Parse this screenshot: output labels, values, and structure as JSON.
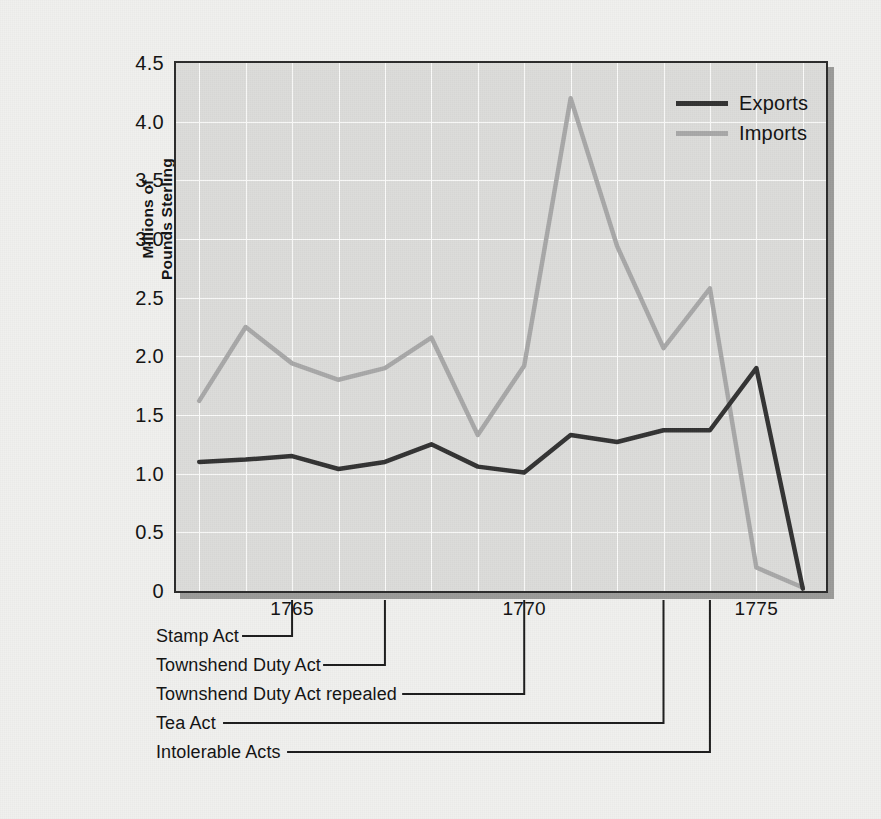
{
  "chart_data": {
    "type": "line",
    "title": "",
    "xlabel": "",
    "ylabel": "Millions of Pounds Sterling",
    "ylabel_lines": [
      "Millions of",
      "Pounds Sterling"
    ],
    "x": [
      1763,
      1764,
      1765,
      1766,
      1767,
      1768,
      1769,
      1770,
      1771,
      1772,
      1773,
      1774,
      1775,
      1776
    ],
    "xlim": [
      1762.5,
      1776.5
    ],
    "ylim": [
      0,
      4.5
    ],
    "xticks": [
      1765,
      1770,
      1775
    ],
    "xtick_labels": [
      "1765",
      "1770",
      "1775"
    ],
    "yticks": [
      0,
      0.5,
      1.0,
      1.5,
      2.0,
      2.5,
      3.0,
      3.5,
      4.0,
      4.5
    ],
    "ytick_labels": [
      "0",
      "0.5",
      "1.0",
      "1.5",
      "2.0",
      "2.5",
      "3.0",
      "3.5",
      "4.0",
      "4.5"
    ],
    "grid": true,
    "grid_color": "#fbfbfa",
    "plot_bg": "#dcdcda",
    "legend_position": "top-right",
    "series": [
      {
        "name": "Exports",
        "color": "#333333",
        "values": [
          1.1,
          1.12,
          1.15,
          1.04,
          1.1,
          1.25,
          1.06,
          1.01,
          1.33,
          1.27,
          1.37,
          1.37,
          1.9,
          0.02
        ]
      },
      {
        "name": "Imports",
        "color": "#a8a8a8",
        "values": [
          1.62,
          2.25,
          1.94,
          1.8,
          1.9,
          2.16,
          1.33,
          1.92,
          4.2,
          2.94,
          2.07,
          2.58,
          0.2,
          0.03
        ]
      }
    ],
    "annotations": [
      {
        "label": "Stamp Act",
        "year": 1765
      },
      {
        "label": "Townshend Duty Act",
        "year": 1767
      },
      {
        "label": "Townshend Duty Act repealed",
        "year": 1770
      },
      {
        "label": "Tea Act",
        "year": 1773
      },
      {
        "label": "Intolerable Acts",
        "year": 1774
      }
    ]
  },
  "legend": {
    "items": [
      {
        "label": "Exports",
        "color": "#333333"
      },
      {
        "label": "Imports",
        "color": "#a8a8a8"
      }
    ]
  }
}
